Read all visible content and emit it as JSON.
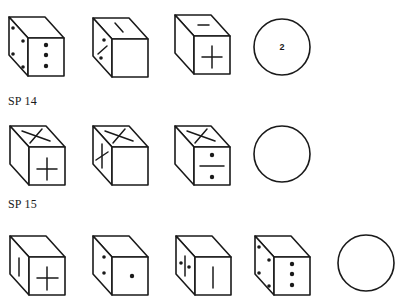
{
  "problems": [
    {
      "label": "",
      "cubes": [
        {
          "top": "blank",
          "left": "four-dots",
          "front": "three-dots-vertical"
        },
        {
          "top": "dash-diagonal",
          "left": "division-sign",
          "front": "blank"
        },
        {
          "top": "minus",
          "left": "blank",
          "front": "plus"
        }
      ],
      "answer": {
        "text": "2"
      }
    },
    {
      "label": "SP 14",
      "cubes": [
        {
          "top": "x-cross",
          "left": "blank",
          "front": "plus"
        },
        {
          "top": "x-cross",
          "left": "plus",
          "front": "blank"
        },
        {
          "top": "x-cross",
          "left": "blank",
          "front": "division-sign"
        }
      ],
      "answer": {
        "text": ""
      }
    },
    {
      "label": "SP 15",
      "cubes": [
        {
          "top": "blank",
          "left": "vertical-line",
          "front": "plus"
        },
        {
          "top": "blank",
          "left": "two-dots",
          "front": "one-dot"
        },
        {
          "top": "blank",
          "left": "line-with-two-dots",
          "front": "vertical-line"
        },
        {
          "top": "blank",
          "left": "four-dots",
          "front": "three-dots-vertical"
        }
      ],
      "answer": {
        "text": ""
      }
    }
  ],
  "colors": {
    "ink": "#1a1a1a",
    "background": "#ffffff"
  }
}
